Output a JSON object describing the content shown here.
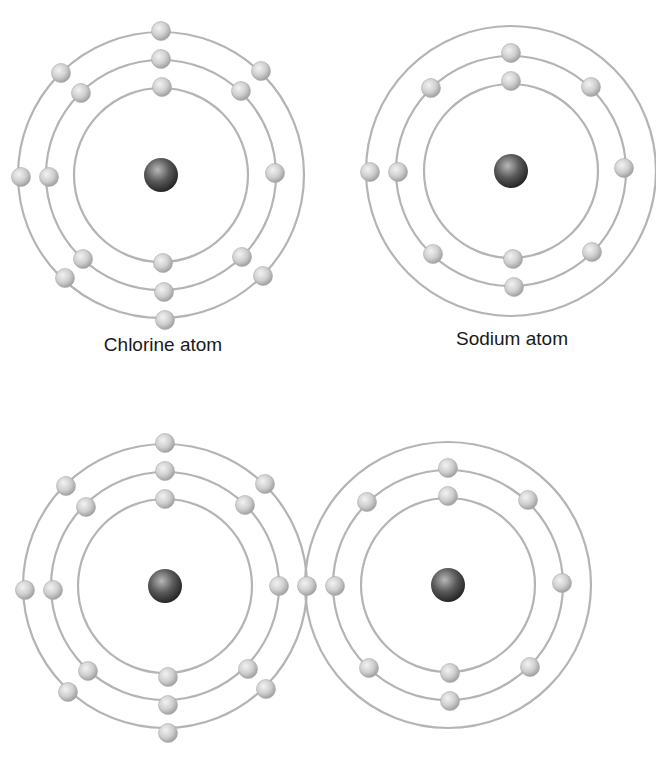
{
  "colors": {
    "background": "#ffffff",
    "orbit": "#b4b4b4",
    "electron_light": "#f2f2f2",
    "electron_mid": "#cfcfcf",
    "electron_dark": "#9a9a9a",
    "nucleus_light": "#b8b8b8",
    "nucleus_mid": "#5a5a5a",
    "nucleus_dark": "#1e1e1e",
    "label": "#1a1a1a"
  },
  "labels": {
    "chlorine": "Chlorine atom",
    "sodium": "Sodium atom"
  },
  "atoms": [
    {
      "id": "chlorine-atom-top",
      "element": "Chlorine",
      "cx": 161,
      "cy": 175,
      "nucleus_r": 17,
      "electron_r": 9.5,
      "electrons_total": 17,
      "shells": [
        {
          "r": 87,
          "electrons": [
            [
              162,
              87
            ],
            [
              163,
              263
            ]
          ]
        },
        {
          "r": 115,
          "electrons": [
            [
              161,
              59
            ],
            [
              241,
              91
            ],
            [
              275,
              173
            ],
            [
              242,
              257
            ],
            [
              164,
              292
            ],
            [
              83,
              259
            ],
            [
              49,
              177
            ],
            [
              81,
              93
            ]
          ]
        },
        {
          "r": 143,
          "electrons": [
            [
              161,
              31
            ],
            [
              261,
              71
            ],
            [
              263,
              276
            ],
            [
              165,
              320
            ],
            [
              65,
              278
            ],
            [
              21,
              177
            ],
            [
              61,
              73
            ]
          ]
        }
      ]
    },
    {
      "id": "sodium-atom-top",
      "element": "Sodium",
      "cx": 511,
      "cy": 171,
      "nucleus_r": 17,
      "electron_r": 9.5,
      "electrons_total": 11,
      "shells": [
        {
          "r": 87,
          "electrons": [
            [
              511,
              81
            ],
            [
              513,
              259
            ]
          ]
        },
        {
          "r": 115,
          "electrons": [
            [
              511,
              53
            ],
            [
              591,
              87
            ],
            [
              624,
              168
            ],
            [
              592,
              252
            ],
            [
              514,
              287
            ],
            [
              433,
              254
            ],
            [
              398,
              172
            ],
            [
              431,
              88
            ]
          ]
        },
        {
          "r": 145,
          "electrons": [
            [
              370,
              172
            ]
          ]
        }
      ]
    },
    {
      "id": "chlorine-atom-bonded",
      "element": "Chlorine",
      "cx": 165,
      "cy": 586,
      "nucleus_r": 17,
      "electron_r": 9.5,
      "electrons_total": 18,
      "shells": [
        {
          "r": 87,
          "electrons": [
            [
              165,
              499
            ],
            [
              168,
              677
            ]
          ]
        },
        {
          "r": 114,
          "electrons": [
            [
              165,
              471
            ],
            [
              245,
              505
            ],
            [
              279,
              586
            ],
            [
              248,
              669
            ],
            [
              168,
              705
            ],
            [
              88,
              671
            ],
            [
              53,
              590
            ],
            [
              86,
              507
            ]
          ]
        },
        {
          "r": 142,
          "electrons": [
            [
              165,
              443
            ],
            [
              265,
              484
            ],
            [
              266,
              689
            ],
            [
              168,
              733
            ],
            [
              68,
              692
            ],
            [
              25,
              590
            ],
            [
              66,
              486
            ],
            [
              307,
              586
            ]
          ]
        }
      ]
    },
    {
      "id": "sodium-atom-bonded",
      "element": "Sodium",
      "cx": 448,
      "cy": 585,
      "nucleus_r": 17,
      "electron_r": 9.5,
      "electrons_total": 10,
      "shells": [
        {
          "r": 87,
          "electrons": [
            [
              448,
              496
            ],
            [
              450,
              673
            ]
          ]
        },
        {
          "r": 115,
          "electrons": [
            [
              448,
              468
            ],
            [
              528,
              500
            ],
            [
              562,
              583
            ],
            [
              530,
              667
            ],
            [
              450,
              701
            ],
            [
              369,
              668
            ],
            [
              335,
              586
            ],
            [
              367,
              502
            ]
          ]
        },
        {
          "r": 143,
          "electrons": []
        }
      ]
    }
  ],
  "label_positions": {
    "chlorine": {
      "x": 163,
      "y": 346
    },
    "sodium": {
      "x": 512,
      "y": 340
    }
  }
}
